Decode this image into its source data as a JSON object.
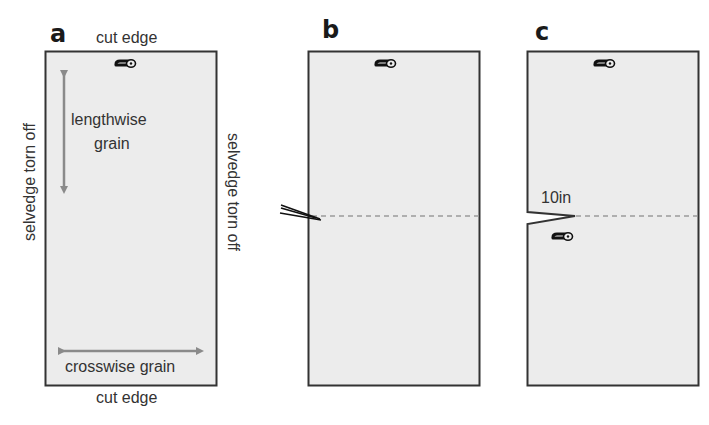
{
  "figure": {
    "panels": [
      {
        "id": "a",
        "label": "a",
        "top_caption": "cut edge",
        "bottom_caption": "cut edge",
        "left_caption": "selvedge torn off",
        "right_caption": "selvedge torn off",
        "lengthwise_label_line1": "lengthwise",
        "lengthwise_label_line2": "grain",
        "crosswise_label": "crosswise grain"
      },
      {
        "id": "b",
        "label": "b"
      },
      {
        "id": "c",
        "label": "c",
        "measure_label": "10in"
      }
    ],
    "icons": [
      "safety-pin-icon",
      "scissors-icon",
      "notch-cut"
    ],
    "colors": {
      "fabric_fill": "#ececec",
      "outline": "#333333",
      "arrow": "#8a8a8a",
      "dashed_line": "#9a9a9a",
      "text": "#333333"
    }
  }
}
